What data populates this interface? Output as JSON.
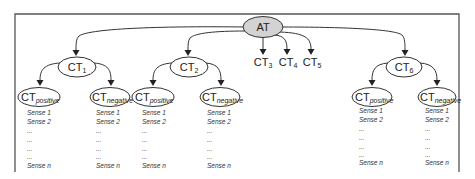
{
  "diagram": {
    "root": {
      "label": "AT",
      "fill": "#d3d3d3"
    },
    "categories": [
      {
        "id": "ct1",
        "base": "CT",
        "sub": "1",
        "expanded": true
      },
      {
        "id": "ct2",
        "base": "CT",
        "sub": "2",
        "expanded": true
      },
      {
        "id": "ct3",
        "base": "CT",
        "sub": "3",
        "expanded": false
      },
      {
        "id": "ct4",
        "base": "CT",
        "sub": "4",
        "expanded": false
      },
      {
        "id": "ct5",
        "base": "CT",
        "sub": "5",
        "expanded": false
      },
      {
        "id": "ct6",
        "base": "CT",
        "sub": "6",
        "expanded": true
      }
    ],
    "polarity": {
      "positive": {
        "base": "CT",
        "sub": "positive"
      },
      "negative": {
        "base": "CT",
        "sub": "negative"
      }
    },
    "senses": [
      "Sense 1",
      "Sense 2",
      "...",
      "...",
      "...",
      "...",
      "Sense n"
    ]
  }
}
